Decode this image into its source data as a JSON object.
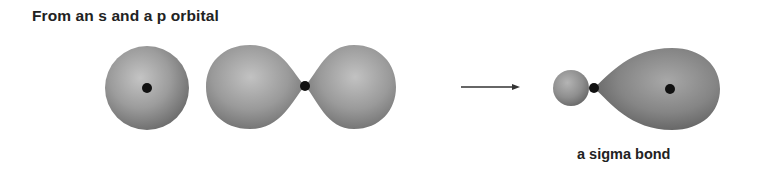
{
  "title": "From an s and a p orbital",
  "caption": "a sigma bond",
  "colors": {
    "orbital_light": "#bdbdbd",
    "orbital_mid": "#9a9a9a",
    "orbital_dark": "#6e6e6e",
    "nucleus": "#111111",
    "arrow": "#333333",
    "text": "#222222"
  },
  "diagram": {
    "s_orbital": {
      "label": "s orbital",
      "cx": 147,
      "cy": 88,
      "r": 42,
      "nucleus": {
        "cx": 147,
        "cy": 88,
        "r": 5
      }
    },
    "p_orbital": {
      "label": "p orbital",
      "nucleus": {
        "cx": 305,
        "cy": 86,
        "r": 5
      },
      "left_lobe": {
        "x_min": 206,
        "y_min": 45,
        "y_max": 129
      },
      "right_lobe": {
        "x_max": 396,
        "y_min": 45,
        "y_max": 129
      }
    },
    "arrow": {
      "x1": 461,
      "x2": 520,
      "y": 87
    },
    "sigma_bond": {
      "label": "sigma bond",
      "small_lobe": {
        "cx": 571,
        "cy": 88,
        "r": 18
      },
      "bond_nucleus": {
        "cx": 594,
        "cy": 88,
        "r": 5
      },
      "large_lobe": {
        "x_max": 720,
        "y_min": 48,
        "y_max": 130
      },
      "far_nucleus": {
        "cx": 670,
        "cy": 89,
        "r": 5
      }
    }
  }
}
